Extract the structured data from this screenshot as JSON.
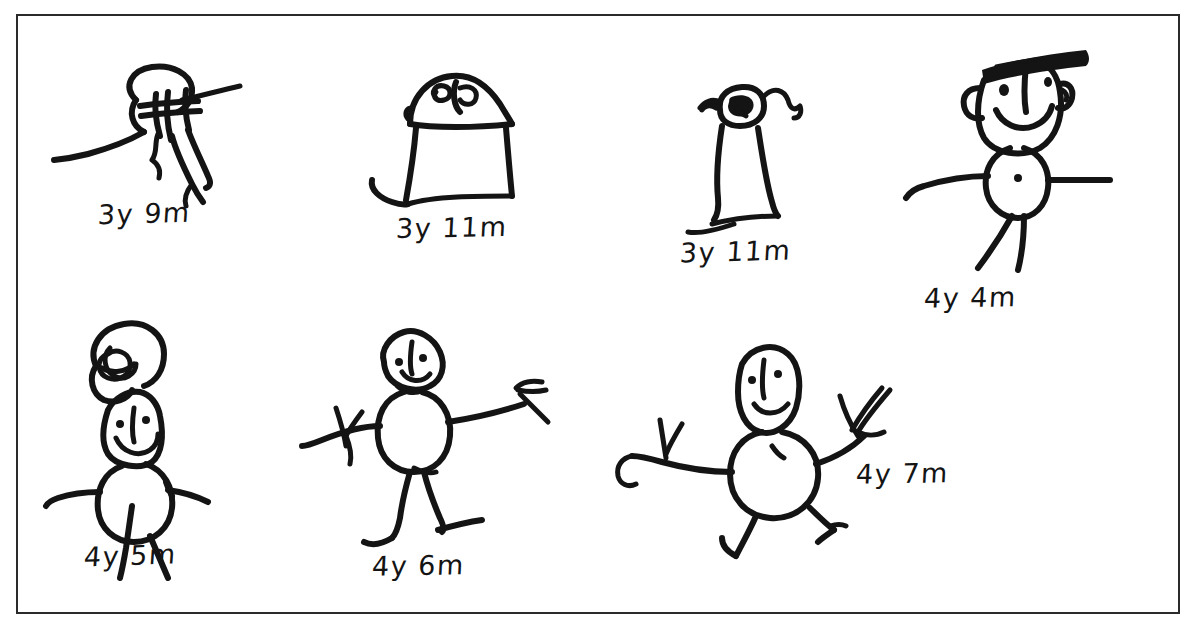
{
  "plate": {
    "title": "Children's human figure drawings",
    "background_color": "#ffffff",
    "ink_color": "#141414",
    "frame_color": "#2b2b2b"
  },
  "rows": [
    {
      "name": "top-row",
      "figure_indexes": [
        0,
        1,
        2,
        3
      ]
    },
    {
      "name": "bottom-row",
      "figure_indexes": [
        4,
        5,
        6
      ]
    }
  ],
  "figures": [
    {
      "id": "figure-1",
      "age_label": "3y 9m",
      "age_years": 3,
      "age_months": 9,
      "description": "scribbled head with radiating limb strokes",
      "row": "top"
    },
    {
      "id": "figure-2",
      "age_label": "3y 11m",
      "age_years": 3,
      "age_months": 11,
      "description": "tall trapezoid body with scribbled face and one leg",
      "row": "top"
    },
    {
      "id": "figure-3",
      "age_label": "3y 11m",
      "age_years": 3,
      "age_months": 11,
      "description": "narrow body with small filled face and wavy arms",
      "row": "top"
    },
    {
      "id": "figure-4",
      "age_label": "4y 4m",
      "age_years": 4,
      "age_months": 4,
      "description": "head with hair bar, ears, eyes, smile, oval body, arms and legs",
      "row": "top"
    },
    {
      "id": "figure-5",
      "age_label": "4y 5m",
      "age_years": 4,
      "age_months": 5,
      "description": "curly hair above square face, oval body, arms and legs",
      "row": "bottom"
    },
    {
      "id": "figure-6",
      "age_label": "4y 6m",
      "age_years": 4,
      "age_months": 6,
      "description": "round head, round body, outstretched arms with fingers, two legs with feet",
      "row": "bottom"
    },
    {
      "id": "figure-7",
      "age_label": "4y 7m",
      "age_years": 4,
      "age_months": 7,
      "description": "running figure, oval head, round body, arms with fingers, bent legs",
      "row": "bottom"
    }
  ]
}
